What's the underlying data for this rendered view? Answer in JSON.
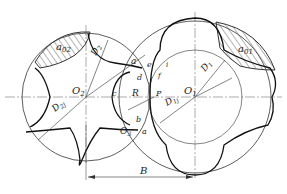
{
  "diagram": {
    "type": "rotor-profile-meshing",
    "labels": {
      "O2": "O",
      "O2_sub": "2",
      "O1": "O",
      "O1_sub": "1",
      "O3": "O",
      "O3_sub": "3",
      "D2": "D",
      "D2_sub": "2",
      "D1": "D",
      "D1_sub": "1",
      "D2j": "D",
      "D2j_sub": "2j",
      "D1j": "D",
      "D1j_sub": "1j",
      "a02": "a",
      "a02_sub": "02",
      "a01": "a",
      "a01_sub": "01",
      "R": "R",
      "P": "P",
      "B": "B",
      "a_top": "a",
      "a_bottom": "a",
      "b": "b",
      "c": "c",
      "d": "d",
      "e": "e",
      "f": "f",
      "i": "i",
      "j": "j"
    },
    "colors": {
      "line": "#333333",
      "background": "#ffffff"
    }
  }
}
